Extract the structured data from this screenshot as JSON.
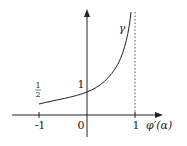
{
  "diagram": {
    "title": "",
    "x_axis": {
      "label": "φ′(α)",
      "ticks": [
        {
          "value": -1,
          "label": "-1"
        },
        {
          "value": 0,
          "label": "0"
        },
        {
          "value": 1,
          "label": "1"
        }
      ]
    },
    "y_axis": {
      "label": "",
      "ticks": [
        {
          "value": 0.5,
          "label_num": "1",
          "label_den": "2"
        },
        {
          "value": 1,
          "label": "1"
        }
      ]
    },
    "curve": {
      "name": "γ",
      "description": "increasing curve from (-1, 1/2) through (0, 1), asymptotic to x = 1"
    },
    "asymptote": {
      "x": 1,
      "style": "dashed"
    },
    "colors": {
      "line": "#222222",
      "background": "#ffffff"
    }
  }
}
